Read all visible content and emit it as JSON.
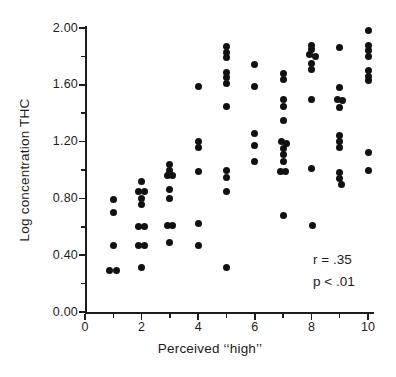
{
  "figure": {
    "y_axis": {
      "label": "Log concentration THC"
    },
    "x_axis": {
      "label": "Perceived ‘‘high’’"
    },
    "annotation": {
      "line1": "r = .35",
      "line2": "p < .01"
    }
  },
  "chart_data": {
    "type": "scatter",
    "title": "",
    "xlabel": "Perceived ‘‘high’’",
    "ylabel": "Log concentration THC",
    "xlim": [
      0,
      10
    ],
    "ylim": [
      0.0,
      2.0
    ],
    "x_major_ticks": [
      0,
      2,
      4,
      6,
      8,
      10
    ],
    "x_minor_ticks": [
      1,
      3,
      5,
      7,
      9
    ],
    "y_major_ticks": [
      0.0,
      0.4,
      0.8,
      1.2,
      1.6,
      2.0
    ],
    "y_minor_ticks": [
      0.2,
      0.6,
      1.0,
      1.4,
      1.8
    ],
    "x_tick_labels": [
      "0",
      "2",
      "4",
      "6",
      "8",
      "10"
    ],
    "y_tick_labels": [
      "0.00",
      "0.40",
      "0.80",
      "1.20",
      "1.60",
      "2.00"
    ],
    "grid": false,
    "legend": null,
    "annotations": [
      "r = .35",
      "p < .01"
    ],
    "colors": {
      "dot": "#111111",
      "axis": "#1b1b1b",
      "background": "#ffffff"
    },
    "points": [
      [
        0.88,
        0.29
      ],
      [
        1.1,
        0.29
      ],
      [
        1,
        0.47
      ],
      [
        1,
        0.7
      ],
      [
        1,
        0.79
      ],
      [
        2,
        0.31
      ],
      [
        1.9,
        0.47
      ],
      [
        2.12,
        0.47
      ],
      [
        1.9,
        0.6
      ],
      [
        2.12,
        0.6
      ],
      [
        2,
        0.76
      ],
      [
        2,
        0.8
      ],
      [
        1.9,
        0.85
      ],
      [
        2.1,
        0.85
      ],
      [
        2,
        0.92
      ],
      [
        3,
        0.49
      ],
      [
        2.9,
        0.61
      ],
      [
        3.1,
        0.61
      ],
      [
        3,
        0.8
      ],
      [
        3,
        0.86
      ],
      [
        2.9,
        0.96
      ],
      [
        3.1,
        0.96
      ],
      [
        3,
        1.0
      ],
      [
        3,
        1.04
      ],
      [
        4,
        0.47
      ],
      [
        4,
        0.62
      ],
      [
        4,
        0.99
      ],
      [
        4,
        1.16
      ],
      [
        4,
        1.2
      ],
      [
        4,
        1.59
      ],
      [
        5,
        0.31
      ],
      [
        5,
        0.85
      ],
      [
        5,
        0.95
      ],
      [
        5,
        1.0
      ],
      [
        5,
        1.45
      ],
      [
        5,
        1.61
      ],
      [
        5,
        1.65
      ],
      [
        5,
        1.69
      ],
      [
        5,
        1.79
      ],
      [
        5,
        1.83
      ],
      [
        5,
        1.87
      ],
      [
        6,
        1.06
      ],
      [
        6,
        1.17
      ],
      [
        6,
        1.26
      ],
      [
        6,
        1.59
      ],
      [
        6,
        1.74
      ],
      [
        7,
        0.68
      ],
      [
        6.92,
        0.99
      ],
      [
        7.1,
        0.99
      ],
      [
        7,
        1.06
      ],
      [
        7,
        1.11
      ],
      [
        7,
        1.15
      ],
      [
        6.95,
        1.2
      ],
      [
        7.13,
        1.19
      ],
      [
        7,
        1.35
      ],
      [
        7,
        1.45
      ],
      [
        7,
        1.5
      ],
      [
        7,
        1.64
      ],
      [
        7,
        1.68
      ],
      [
        8.05,
        0.61
      ],
      [
        8,
        1.01
      ],
      [
        8,
        1.5
      ],
      [
        8,
        1.71
      ],
      [
        8,
        1.75
      ],
      [
        7.95,
        1.81
      ],
      [
        8.13,
        1.8
      ],
      [
        8,
        1.85
      ],
      [
        8,
        1.88
      ],
      [
        9.07,
        0.9
      ],
      [
        9,
        0.94
      ],
      [
        9,
        0.98
      ],
      [
        9,
        1.16
      ],
      [
        9,
        1.2
      ],
      [
        9,
        1.24
      ],
      [
        9,
        1.44
      ],
      [
        8.93,
        1.5
      ],
      [
        9.1,
        1.49
      ],
      [
        9,
        1.58
      ],
      [
        9,
        1.86
      ],
      [
        10,
        1.0
      ],
      [
        10,
        1.12
      ],
      [
        10,
        1.63
      ],
      [
        10,
        1.66
      ],
      [
        10,
        1.7
      ],
      [
        10,
        1.8
      ],
      [
        10,
        1.84
      ],
      [
        10,
        1.88
      ],
      [
        10,
        1.98
      ]
    ]
  }
}
